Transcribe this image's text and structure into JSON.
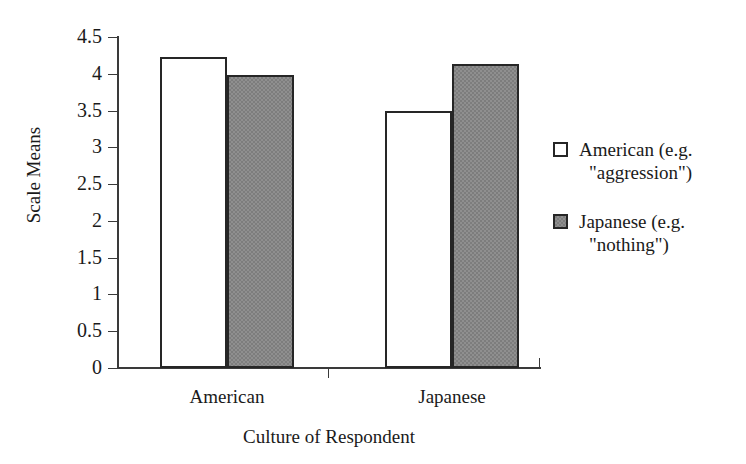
{
  "chart_data": {
    "type": "bar",
    "title": "",
    "xlabel": "Culture of Respondent",
    "ylabel": "Scale Means",
    "categories": [
      "American",
      "Japanese"
    ],
    "series": [
      {
        "name": "American (e.g. \"aggression\")",
        "name_line1": "American (e.g.",
        "name_line2": "\"aggression\")",
        "color": "#ffffff",
        "values": [
          4.23,
          3.5
        ]
      },
      {
        "name": "Japanese (e.g. \"nothing\")",
        "name_line1": "Japanese (e.g.",
        "name_line2": "\"nothing\")",
        "color": "#7d7d7d",
        "values": [
          3.99,
          4.13
        ]
      }
    ],
    "ylim": [
      0,
      4.5
    ],
    "ytick_labels": [
      "0",
      "0.5",
      "1",
      "1.5",
      "2",
      "2.5",
      "3",
      "3.5",
      "4",
      "4.5"
    ],
    "ytick_values": [
      0,
      0.5,
      1,
      1.5,
      2,
      2.5,
      3,
      3.5,
      4,
      4.5
    ],
    "grid": false,
    "legend_position": "right",
    "axis_color": "#3a3a3a",
    "bar_outline_color": "#262626"
  }
}
